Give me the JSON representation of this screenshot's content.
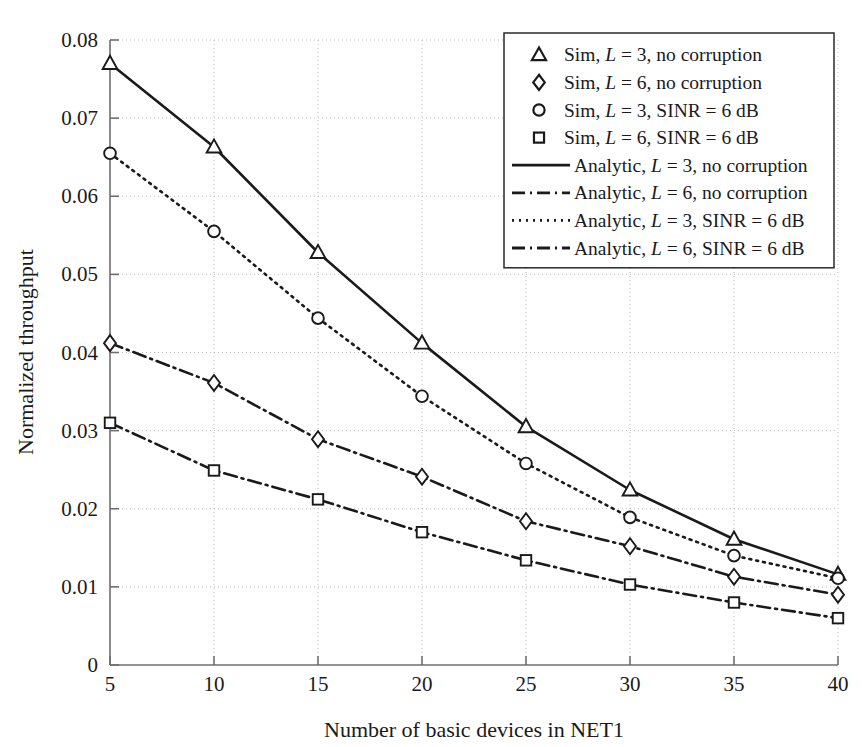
{
  "chart_data": {
    "type": "line",
    "title": "",
    "xlabel": "Number of basic devices in NET1",
    "ylabel": "Normalized throughput",
    "x": [
      5,
      10,
      15,
      20,
      25,
      30,
      35,
      40
    ],
    "xlim": [
      5,
      40
    ],
    "ylim": [
      0,
      0.08
    ],
    "xticks": [
      "5",
      "10",
      "15",
      "20",
      "25",
      "30",
      "35",
      "40"
    ],
    "yticks": [
      "0",
      "0.01",
      "0.02",
      "0.03",
      "0.04",
      "0.05",
      "0.06",
      "0.07",
      "0.08"
    ],
    "ytick_values": [
      0,
      0.01,
      0.02,
      0.03,
      0.04,
      0.05,
      0.06,
      0.07,
      0.08
    ],
    "grid": true,
    "legend_position": "top-right",
    "series": [
      {
        "name": "Sim, L = 3, no corruption",
        "marker": "triangle",
        "line": "none",
        "values": [
          0.077,
          0.0663,
          0.0528,
          0.0412,
          0.0305,
          0.0224,
          0.0161,
          0.0116
        ]
      },
      {
        "name": "Sim, L = 6, no corruption",
        "marker": "diamond",
        "line": "none",
        "values": [
          0.0412,
          0.0361,
          0.0289,
          0.0241,
          0.0184,
          0.0152,
          0.0113,
          0.009
        ]
      },
      {
        "name": "Sim, L = 3, SINR = 6 dB",
        "marker": "circle",
        "line": "none",
        "values": [
          0.0655,
          0.0555,
          0.0444,
          0.0344,
          0.0258,
          0.0189,
          0.014,
          0.0111
        ]
      },
      {
        "name": "Sim, L = 6, SINR = 6 dB",
        "marker": "square",
        "line": "none",
        "values": [
          0.031,
          0.0249,
          0.0212,
          0.017,
          0.0134,
          0.0103,
          0.008,
          0.006
        ]
      },
      {
        "name": "Analytic, L = 3, no corruption",
        "marker": "none",
        "line": "solid",
        "values": [
          0.077,
          0.0663,
          0.0528,
          0.0412,
          0.0305,
          0.0224,
          0.0161,
          0.0116
        ]
      },
      {
        "name": "Analytic, L = 6, no corruption",
        "marker": "none",
        "line": "dashdot",
        "values": [
          0.0412,
          0.0361,
          0.0289,
          0.0241,
          0.0184,
          0.0152,
          0.0113,
          0.009
        ]
      },
      {
        "name": "Analytic, L = 3, SINR = 6 dB",
        "marker": "none",
        "line": "dotted",
        "values": [
          0.0655,
          0.0555,
          0.0444,
          0.0344,
          0.0258,
          0.0189,
          0.014,
          0.0111
        ]
      },
      {
        "name": "Analytic, L = 6, SINR = 6 dB",
        "marker": "none",
        "line": "dashdot",
        "values": [
          0.031,
          0.0249,
          0.0212,
          0.017,
          0.0134,
          0.0103,
          0.008,
          0.006
        ]
      }
    ]
  },
  "legend": {
    "entries": [
      {
        "symbol": "triangle",
        "prefix": "Sim, ",
        "var": "L",
        "suffix": " = 3, no corruption"
      },
      {
        "symbol": "diamond",
        "prefix": "Sim, ",
        "var": "L",
        "suffix": " = 6, no corruption"
      },
      {
        "symbol": "circle",
        "prefix": "Sim, ",
        "var": "L",
        "suffix": " = 3, SINR = 6 dB"
      },
      {
        "symbol": "square",
        "prefix": "Sim, ",
        "var": "L",
        "suffix": " = 6, SINR = 6 dB"
      },
      {
        "symbol": "solid-line",
        "prefix": "Analytic, ",
        "var": "L",
        "suffix": " = 3, no corruption"
      },
      {
        "symbol": "dashdot-line",
        "prefix": "Analytic, ",
        "var": "L",
        "suffix": " = 6, no corruption"
      },
      {
        "symbol": "dotted-line",
        "prefix": "Analytic, ",
        "var": "L",
        "suffix": " = 3, SINR = 6 dB"
      },
      {
        "symbol": "dashdot-line",
        "prefix": "Analytic, ",
        "var": "L",
        "suffix": " = 6, SINR = 6 dB"
      }
    ]
  },
  "colors": {
    "line": "#1a1a1a",
    "grid": "#bdbdbd",
    "axis": "#6e6e6e",
    "background": "#ffffff"
  }
}
